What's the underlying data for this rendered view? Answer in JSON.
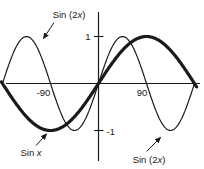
{
  "figure": {
    "background": "#ffffff",
    "ink": "#1a1a1a"
  },
  "chart_data": {
    "type": "line",
    "title": "",
    "grid": false,
    "legend": false,
    "x_axis": {
      "unit": "degrees",
      "min": -180,
      "max": 180,
      "ticks": [
        {
          "value": -90,
          "label": "-90"
        },
        {
          "value": 90,
          "label": "90"
        }
      ]
    },
    "y_axis": {
      "min": -1,
      "max": 1,
      "ticks": [
        {
          "value": 1,
          "label": "1"
        },
        {
          "value": -1,
          "label": "-1"
        }
      ]
    },
    "series": [
      {
        "name": "Sin x",
        "function": "sine",
        "frequency_multiplier": 1,
        "amplitude": 1,
        "x_domain_deg": [
          -182,
          184.5
        ],
        "line": "thick"
      },
      {
        "name": "Sin (2x)",
        "function": "sine",
        "frequency_multiplier": 2,
        "amplitude": 1,
        "x_domain_deg": [
          -180,
          180
        ],
        "line": "thin"
      }
    ],
    "annotations": [
      {
        "pre": "Sin (2",
        "var": "x",
        "post": ")",
        "series": "Sin (2x)",
        "placement": "top-left"
      },
      {
        "pre": "Sin ",
        "var": "x",
        "post": "",
        "series": "Sin x",
        "placement": "bottom-left"
      },
      {
        "pre": "Sin (2",
        "var": "x",
        "post": ")",
        "series": "Sin (2x)",
        "placement": "bottom-right"
      }
    ]
  }
}
